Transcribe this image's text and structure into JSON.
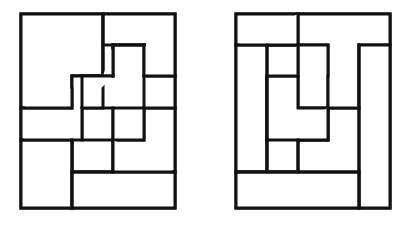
{
  "page": {
    "background_color": "#ffffff",
    "line_color": "#111111",
    "fill_color": "#ffffff",
    "width": 412,
    "height": 225
  },
  "figures": [
    {
      "id": "left-figure",
      "name": "left-dissection-figure",
      "label": "",
      "outline": {
        "x": 21,
        "y": 14,
        "width": 154,
        "height": 194
      },
      "grid": {
        "cols": 5,
        "rows": 6,
        "cell_width": 30.8,
        "cell_height": 32.33
      },
      "piece_count": 6,
      "pieces": [
        {
          "name": "piece-left-top-tall-rect",
          "path": "M21,14 L103,14 L103,76 L72,76 L72,108 L21,108 Z"
        },
        {
          "name": "piece-upper-right-block",
          "path": "M103,14 L175,14 L175,76 L144,76 L144,45 L113,45 L113,76 L103,76 Z"
        },
        {
          "name": "piece-center-plus",
          "path": "M113,45 L144,45 L144,76 L175,76 L175,108 L144,108 L144,140 L113,140 L113,108 L82,108 L82,76 L113,76 Z"
        },
        {
          "name": "piece-middle-left-step",
          "path": "M72,76 L103,76 L103,108 L82,108 L82,140 L113,140 L113,172 L72,172 L72,140 L21,140 L21,108 L72,108 Z"
        },
        {
          "name": "piece-lower-right-step",
          "path": "M144,108 L175,108 L175,172 L113,172 L113,140 L144,140 Z"
        },
        {
          "name": "piece-bottom-strip",
          "path": "M21,140 L72,140 L72,208 L21,208 Z"
        },
        {
          "name": "piece-bottom-right-strip",
          "path": "M72,172 L175,172 L175,208 L72,208 Z"
        }
      ],
      "segments": [
        "M103,14 L103,76",
        "M21,108 L72,108 L72,76 L103,76",
        "M103,45 L113,45 L113,45",
        "M113,45 L144,45 L144,45",
        "M144,45 L144,76 L175,76",
        "M103,76 L113,76 L113,45",
        "M82,108 L82,76 L113,76",
        "M144,76 L144,108 L175,108",
        "M113,140 L144,140 L144,108 L113,108 L113,140",
        "M82,108 L82,140 L21,140",
        "M72,140 L72,208",
        "M113,140 L113,172 L175,172",
        "M72,172 L113,172"
      ]
    },
    {
      "id": "right-figure",
      "name": "right-dissection-figure",
      "label": "",
      "outline": {
        "x": 236,
        "y": 14,
        "width": 154,
        "height": 194
      },
      "grid": {
        "cols": 5,
        "rows": 6,
        "cell_width": 30.8,
        "cell_height": 32.33
      },
      "piece_count": 6,
      "pieces": [
        {
          "name": "piece-top-left-bar",
          "path": "M236,14 L298,14 L298,45 L236,45 Z"
        },
        {
          "name": "piece-top-right-tee",
          "path": "M298,14 L390,14 L390,45 L359,45 L359,108 L328,108 L328,45 L298,45 Z"
        },
        {
          "name": "piece-left-column",
          "path": "M236,45 L267,45 L267,172 L236,172 Z"
        },
        {
          "name": "piece-inner-s-shape",
          "path": "M267,45 L298,45 L298,108 L328,108 L328,140 L267,140 L267,76 L298,76 L298,45"
        },
        {
          "name": "piece-right-column",
          "path": "M359,45 L390,45 L390,208 L359,208 Z"
        },
        {
          "name": "piece-center-zigzag",
          "path": "M267,76 L298,76 L298,108 L328,108 L328,140 L298,140 L298,172 L267,172 Z"
        },
        {
          "name": "piece-bottom-bar",
          "path": "M236,172 L359,172 L359,208 L236,208 Z"
        }
      ],
      "segments": [
        "M298,14 L298,45 L236,45",
        "M267,45 L267,172",
        "M298,45 L328,45 L328,108 L359,108",
        "M359,45 L359,208",
        "M298,45 L298,76 L267,76",
        "M267,140 L328,140 L328,108",
        "M298,140 L298,172",
        "M236,172 L359,172"
      ]
    }
  ]
}
